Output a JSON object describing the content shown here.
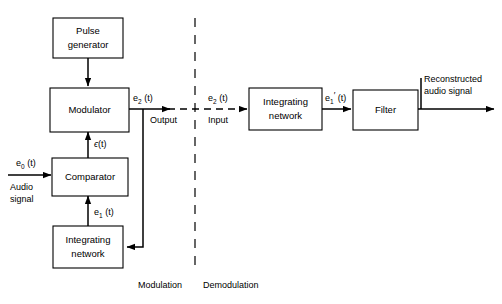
{
  "diagram": {
    "background_color": "#ffffff",
    "line_color": "#000000",
    "blocks": [
      {
        "id": "pulse-generator",
        "line1": "Pulse",
        "line2": "generator"
      },
      {
        "id": "modulator",
        "line1": "Modulator",
        "line2": ""
      },
      {
        "id": "comparator",
        "line1": "Comparator",
        "line2": ""
      },
      {
        "id": "integrating-network-tx",
        "line1": "Integrating",
        "line2": "network"
      },
      {
        "id": "integrating-network-rx",
        "line1": "Integrating",
        "line2": "network"
      },
      {
        "id": "filter",
        "line1": "Filter",
        "line2": ""
      }
    ],
    "signals": {
      "audio_in_main": "e",
      "audio_in_sub": "0",
      "audio_in_tail": " (t)",
      "audio_in_caption_line1": "Audio",
      "audio_in_caption_line2": "signal",
      "epsilon_main": "ϵ",
      "epsilon_tail": "(t)",
      "e1_main": "e",
      "e1_sub": "1",
      "e1_tail": " (t)",
      "e2_out_main": "e",
      "e2_out_sub": "2",
      "e2_out_tail": " (t)",
      "e2_out_caption": "Output",
      "e2_in_main": "e",
      "e2_in_sub": "2",
      "e2_in_tail": " (t)",
      "e2_in_caption": "Input",
      "e1prime_main": "e",
      "e1prime_sub": "1",
      "e1prime_prime": "′",
      "e1prime_tail": " (t)",
      "reconstructed_line1": "Reconstructed",
      "reconstructed_line2": "audio signal"
    },
    "regions": {
      "left_label": "Modulation",
      "right_label": "Demodulation"
    }
  }
}
